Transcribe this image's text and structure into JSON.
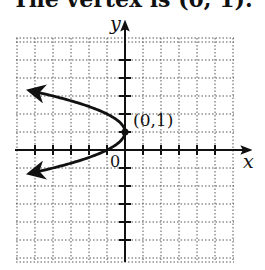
{
  "caption": "The vertex is (0, 1).",
  "chart_data": {
    "type": "line",
    "title": "The vertex is (0, 1).",
    "xlabel": "x",
    "ylabel": "y",
    "xlim": [
      -6,
      6
    ],
    "ylim": [
      -6,
      6
    ],
    "grid": true,
    "grid_style": "dotted",
    "origin_label": "0",
    "annotations": [
      {
        "text": "(0,1)",
        "x": 0,
        "y": 1,
        "point": true
      }
    ],
    "series": [
      {
        "name": "x = -(y - 1)^2",
        "equation": "x = -(y-1)^2",
        "shape": "parabola opening left",
        "vertex": [
          0,
          1
        ],
        "arrows_at_ends": true,
        "points": [
          {
            "x": -6.25,
            "y": 3.5
          },
          {
            "x": -4,
            "y": 3
          },
          {
            "x": -2.25,
            "y": 2.5
          },
          {
            "x": -1,
            "y": 2
          },
          {
            "x": -0.25,
            "y": 1.5
          },
          {
            "x": 0,
            "y": 1
          },
          {
            "x": -0.25,
            "y": 0.5
          },
          {
            "x": -1,
            "y": 0
          },
          {
            "x": -2.25,
            "y": -0.5
          },
          {
            "x": -4,
            "y": -1
          },
          {
            "x": -6.25,
            "y": -1.5
          }
        ]
      }
    ]
  },
  "labels": {
    "x_axis": "x",
    "y_axis": "y",
    "origin": "0",
    "vertex": "(0,1)"
  }
}
